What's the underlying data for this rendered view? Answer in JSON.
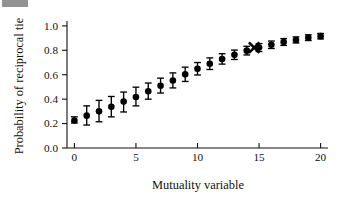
{
  "figure": {
    "background_color": "#ffffff",
    "foreground_color": "#000000",
    "corner_artifact": "scan-artifact"
  },
  "chart_data": {
    "type": "scatter",
    "title": "",
    "subtitle": "",
    "xlabel": "Mutuality variable",
    "ylabel": "Probability of reciprocal tie",
    "xlim": [
      -0.6,
      20.6
    ],
    "ylim": [
      0.0,
      1.04
    ],
    "xticks": [
      0,
      5,
      10,
      15,
      20
    ],
    "xticklabels": [
      "0",
      "5",
      "10",
      "15",
      "20"
    ],
    "yticks": [
      0.0,
      0.2,
      0.4,
      0.6,
      0.8,
      1.0
    ],
    "yticklabels": [
      "0.0",
      "0.2",
      "0.4",
      "0.6",
      "0.8",
      "1.0"
    ],
    "grid": false,
    "legend": null,
    "marker": "filled-circle",
    "errorbar_style": "capped-vertical",
    "x": [
      0,
      1,
      2,
      3,
      4,
      5,
      6,
      7,
      8,
      9,
      10,
      11,
      12,
      13,
      14,
      15,
      16,
      17,
      18,
      19,
      20
    ],
    "y": [
      0.225,
      0.265,
      0.3,
      0.337,
      0.38,
      0.418,
      0.465,
      0.51,
      0.553,
      0.603,
      0.648,
      0.69,
      0.728,
      0.763,
      0.797,
      0.822,
      0.845,
      0.868,
      0.885,
      0.903,
      0.916
    ],
    "y_err_low": [
      0.205,
      0.188,
      0.215,
      0.255,
      0.295,
      0.345,
      0.4,
      0.45,
      0.492,
      0.545,
      0.598,
      0.643,
      0.687,
      0.725,
      0.762,
      0.79,
      0.815,
      0.84,
      0.86,
      0.88,
      0.893
    ],
    "y_err_high": [
      0.255,
      0.345,
      0.39,
      0.422,
      0.458,
      0.498,
      0.532,
      0.572,
      0.615,
      0.662,
      0.7,
      0.738,
      0.772,
      0.802,
      0.833,
      0.855,
      0.876,
      0.896,
      0.91,
      0.927,
      0.938
    ],
    "annotations": [
      {
        "name": "cross-marker",
        "marker": "x-cross",
        "x": 14.6,
        "y": 0.822,
        "label": ""
      }
    ]
  }
}
